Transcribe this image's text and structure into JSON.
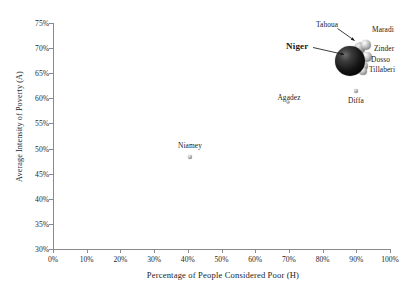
{
  "chart_data": {
    "type": "scatter",
    "title": "",
    "xlabel": "Percentage of People Considered Poor (H)",
    "ylabel": "Average Intensity of Poverty (A)",
    "xlim": [
      0,
      100
    ],
    "ylim": [
      30,
      75
    ],
    "xtick_labels": [
      "0%",
      "10%",
      "20%",
      "30%",
      "40%",
      "50%",
      "60%",
      "70%",
      "80%",
      "90%",
      "100%"
    ],
    "xtick_values": [
      0,
      10,
      20,
      30,
      40,
      50,
      60,
      70,
      80,
      90,
      100
    ],
    "ytick_labels": [
      "30%",
      "35%",
      "40%",
      "45%",
      "50%",
      "55%",
      "60%",
      "65%",
      "70%",
      "75%"
    ],
    "ytick_values": [
      30,
      35,
      40,
      45,
      50,
      55,
      60,
      65,
      70,
      75
    ],
    "grid": false,
    "legend": "none",
    "bubble_note": "Marker area scales with population; Niger is the national aggregate shown as the large dark sphere.",
    "points": [
      {
        "name": "Niger",
        "x": 88.0,
        "y": 67.5,
        "size": 30,
        "shade": "dark",
        "label_pos": "left-arrow"
      },
      {
        "name": "Tahoua",
        "x": 91.0,
        "y": 70.0,
        "size": 11,
        "shade": "mid",
        "label_pos": "up-arrow"
      },
      {
        "name": "Maradi",
        "x": 93.0,
        "y": 70.6,
        "size": 10,
        "shade": "light",
        "label_pos": "right"
      },
      {
        "name": "Zinder",
        "x": 93.2,
        "y": 68.2,
        "size": 10,
        "shade": "light",
        "label_pos": "right"
      },
      {
        "name": "Dosso",
        "x": 92.4,
        "y": 66.4,
        "size": 8,
        "shade": "light",
        "label_pos": "right"
      },
      {
        "name": "Tillaberi",
        "x": 92.0,
        "y": 65.4,
        "size": 8,
        "shade": "light",
        "label_pos": "right"
      },
      {
        "name": "Diffa",
        "x": 89.8,
        "y": 61.4,
        "size": 4,
        "shade": "mid",
        "label_pos": "below"
      },
      {
        "name": "Agadez",
        "x": 69.8,
        "y": 59.3,
        "size": 3,
        "shade": "mid",
        "label_pos": "above"
      },
      {
        "name": "Niamey",
        "x": 40.6,
        "y": 48.4,
        "size": 4,
        "shade": "mid",
        "label_pos": "above"
      }
    ],
    "labels": {
      "niger": "Niger",
      "tahoua": "Tahoua",
      "maradi": "Maradi",
      "zinder": "Zinder",
      "dosso": "Dosso",
      "tillaberi": "Tillaberi",
      "diffa": "Diffa",
      "agadez": "Agadez",
      "niamey": "Niamey"
    },
    "colors": {
      "axis": "#8a8a8a",
      "text": "#1a1a1a",
      "dark_bubble": "#000000",
      "light_bubble": "#c8c8c8",
      "background": "#ffffff"
    }
  }
}
